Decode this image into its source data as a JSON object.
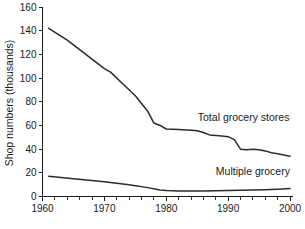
{
  "chart_data": {
    "type": "line",
    "title": "",
    "xlabel": "",
    "ylabel": "Shop numbers (thousands)",
    "xlim": [
      1960,
      2000
    ],
    "ylim": [
      0,
      160
    ],
    "grid": false,
    "legend_position": "inline-right",
    "x_ticks": [
      1960,
      1970,
      1980,
      1990,
      2000
    ],
    "x_tick_labels": [
      "1960",
      "1970",
      "1980",
      "1990",
      "2000"
    ],
    "x_minor_tick_step": 2,
    "y_ticks": [
      0,
      20,
      40,
      60,
      80,
      100,
      120,
      140,
      160
    ],
    "y_tick_labels": [
      "0",
      "20",
      "40",
      "60",
      "80",
      "100",
      "120",
      "140",
      "160"
    ],
    "series": [
      {
        "name": "Total grocery stores",
        "label": "Total grocery stores",
        "color": "#2b2b2b",
        "x": [
          1961,
          1964,
          1967,
          1970,
          1971,
          1973,
          1975,
          1977,
          1978,
          1979,
          1980,
          1982,
          1984,
          1985,
          1986,
          1987,
          1988,
          1989,
          1990,
          1991,
          1992,
          1993,
          1994,
          1995,
          1996,
          1997,
          1998,
          1999,
          2000
        ],
        "values": [
          142,
          132,
          120,
          108,
          105,
          95,
          85,
          72,
          62,
          60,
          57,
          56.5,
          56,
          55.5,
          54,
          52,
          51.5,
          51,
          50.5,
          48,
          40,
          39.5,
          40,
          39.5,
          38.5,
          37,
          36,
          35,
          34
        ]
      },
      {
        "name": "Multiple grocery",
        "label": "Multiple grocery",
        "color": "#2b2b2b",
        "x": [
          1961,
          1965,
          1970,
          1974,
          1977,
          1979,
          1980,
          1982,
          1984,
          1986,
          1988,
          1990,
          1992,
          1994,
          1996,
          1998,
          2000
        ],
        "values": [
          17,
          15,
          12.5,
          10,
          7.5,
          5.5,
          5,
          4.7,
          4.6,
          4.7,
          4.9,
          5,
          5.2,
          5.5,
          5.8,
          6.2,
          6.8
        ]
      }
    ],
    "annotations": [
      {
        "text": "Total grocery stores",
        "x": 1992.5,
        "y": 64
      },
      {
        "text": "Multiple grocery",
        "x": 1994.0,
        "y": 18
      }
    ]
  }
}
